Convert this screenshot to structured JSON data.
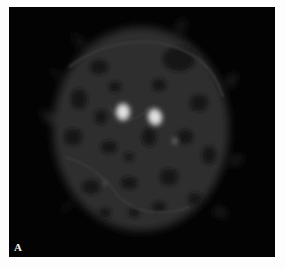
{
  "figure": {
    "panel_label": "A",
    "background": "#030303",
    "page_background": "#fdfdfd"
  }
}
